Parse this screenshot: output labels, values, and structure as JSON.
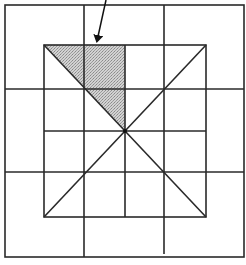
{
  "diagram": {
    "type": "grid-with-inscribed-square",
    "width": 246,
    "height": 265,
    "colors": {
      "line": "#2a2a2a",
      "shade": "#c4c4c4",
      "shade_dark": "#a8a8a8",
      "background": "#ffffff"
    },
    "outer_frame": {
      "x1": 5,
      "y1": 5,
      "x2": 244,
      "y2": 257
    },
    "grid_vertical": [
      84,
      164
    ],
    "grid_horizontal": [
      89,
      172
    ],
    "inner_square": {
      "x1": 44,
      "y1": 45,
      "x2": 206,
      "y2": 217
    },
    "inner_midlines": {
      "vertical_x": 125,
      "horizontal_y": 131
    },
    "center": {
      "x": 125,
      "y": 131
    },
    "shaded_region": {
      "shape": "triangle",
      "points": [
        [
          44,
          45
        ],
        [
          125,
          45
        ],
        [
          125,
          131
        ]
      ]
    },
    "arrow": {
      "from": [
        106,
        0
      ],
      "to": [
        97,
        47
      ]
    }
  }
}
